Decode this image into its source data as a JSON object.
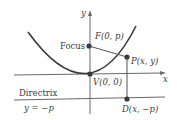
{
  "diagram": {
    "axes": {
      "x_label": "x",
      "y_label": "y"
    },
    "labels": {
      "focus_word": "Focus",
      "focus_point": "F(0, p)",
      "point_p": "P(x, y)",
      "vertex": "V(0, 0)",
      "directrix_word": "Directrix",
      "directrix_eq": "y = −p",
      "point_d": "D(x, −p)"
    },
    "colors": {
      "curve": "#3a3a3a",
      "axis": "#6a6a6a",
      "point": "#3a3a3a",
      "text": "#3a3a3a"
    }
  }
}
